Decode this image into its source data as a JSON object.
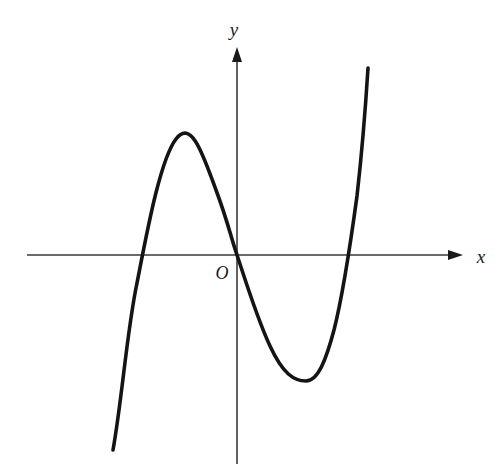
{
  "figure": {
    "kind": "coordinate-plane-graph",
    "background_color": "#ffffff",
    "width": 497,
    "height": 476
  },
  "axes": {
    "x_axis": {
      "label": "x",
      "label_x": 481,
      "label_y": 263,
      "color": "#3a3a3a",
      "stroke_width": 1.6,
      "start_x": 27,
      "end_x": 463,
      "y": 255,
      "arrow": "right"
    },
    "y_axis": {
      "label": "y",
      "label_x": 234,
      "label_y": 36,
      "color": "#3a3a3a",
      "stroke_width": 1.6,
      "x": 237,
      "start_y": 464,
      "end_y": 47,
      "arrow": "up"
    },
    "origin": {
      "label": "O",
      "label_x": 222,
      "label_y": 279,
      "x": 237,
      "y": 255
    }
  },
  "curve": {
    "name": "cubic-curve",
    "color": "#141414",
    "stroke_width": 3.6,
    "path": "M 113,450 C 122,400 127,330 137,283 C 147,232 160,160 176,139 C 192,118 204,158 216,190 C 228,222 231,238 237,255 C 247,285 257,318 270,346 C 283,374 294,381 306,381 C 318,381 326,360 334,330 C 344,291 351,240 357,196 C 362,152 366,100 368,68"
  },
  "chart_data": {
    "type": "line",
    "title": "",
    "xlabel": "x",
    "ylabel": "y",
    "subtitle": "",
    "grid": false,
    "legend": "none",
    "annotations": [
      "O"
    ],
    "features": {
      "x_intercepts_pixels": [
        135,
        237,
        355
      ],
      "local_maximum_pixel": [
        176,
        139
      ],
      "local_minimum_pixel": [
        306,
        381
      ],
      "passes_through_origin": true,
      "leading_coefficient_sign": "positive",
      "degree": 3,
      "end_behavior_left": "down",
      "end_behavior_right": "up"
    },
    "x": [
      113,
      125,
      137,
      150,
      162,
      176,
      190,
      205,
      220,
      237,
      255,
      272,
      290,
      306,
      322,
      338,
      350,
      360,
      368
    ],
    "y": [
      450,
      393,
      283,
      215,
      163,
      139,
      143,
      170,
      212,
      255,
      305,
      348,
      375,
      381,
      357,
      300,
      230,
      150,
      68
    ],
    "series": [
      {
        "name": "cubic",
        "values": [
          450,
          393,
          283,
          215,
          163,
          139,
          143,
          170,
          212,
          255,
          305,
          348,
          375,
          381,
          357,
          300,
          230,
          150,
          68
        ]
      }
    ],
    "xlim": [
      27,
      463
    ],
    "ylim": [
      464,
      47
    ]
  }
}
